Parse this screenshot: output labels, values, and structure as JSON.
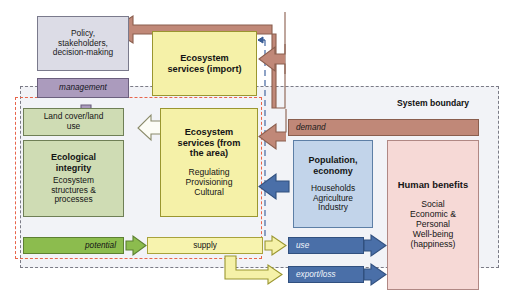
{
  "diagram": {
    "system_boundary_label": "System boundary"
  },
  "boxes": {
    "policy": {
      "line1": "Policy,",
      "line2": "stakeholders,",
      "line3": "decision-making"
    },
    "management": {
      "label": "management"
    },
    "es_import": {
      "title_line1": "Ecosystem",
      "title_line2": "services (import)"
    },
    "land_cover": {
      "line1": "Land cover/land",
      "line2": "use"
    },
    "ecological_integrity": {
      "title_line1": "Ecological",
      "title_line2": "integrity",
      "sub_line1": "Ecosystem",
      "sub_line2": "structures &",
      "sub_line3": "processes"
    },
    "es_area": {
      "title_line1": "Ecosystem",
      "title_line2": "services (from",
      "title_line3": "the area)",
      "sub_line1": "Regulating",
      "sub_line2": "Provisioning",
      "sub_line3": "Cultural"
    },
    "population_economy": {
      "title_line1": "Population,",
      "title_line2": "economy",
      "sub_line1": "Households",
      "sub_line2": "Agriculture",
      "sub_line3": "Industry"
    },
    "human_benefits": {
      "title": "Human benefits",
      "sub_line1": "Social",
      "sub_line2": "Economic &",
      "sub_line3": "Personal",
      "sub_line4": "Well-being",
      "sub_line5": "(happiness)"
    }
  },
  "flows": {
    "potential": {
      "label": "potential"
    },
    "supply": {
      "label": "supply"
    },
    "use": {
      "label": "use"
    },
    "export_loss": {
      "label": "export/loss"
    },
    "demand": {
      "label": "demand"
    }
  },
  "colors": {
    "policy_box": "#dcdce6",
    "management_box": "#ab9bbd",
    "ecosystem_services": "#f5f1a8",
    "ecological_green_light": "#cfdcb4",
    "potential_green": "#8cbc4e",
    "population_blue_light": "#c2d4ea",
    "use_blue_dark": "#4a6fa8",
    "human_benefits_pink": "#f6d9d6",
    "demand_brown": "#c08878",
    "eco_boundary_dashed": "#e8654b",
    "system_boundary_dashed": "#7b7b86"
  }
}
